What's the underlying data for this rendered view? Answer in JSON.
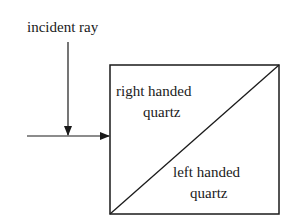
{
  "diagram": {
    "labels": {
      "incident_ray": "incident ray",
      "top_region_line1": "right handed",
      "top_region_line2": "quartz",
      "bottom_region_line1": "left handed",
      "bottom_region_line2": "quartz"
    },
    "colors": {
      "stroke": "#1a1a1a",
      "background": "#ffffff"
    }
  }
}
